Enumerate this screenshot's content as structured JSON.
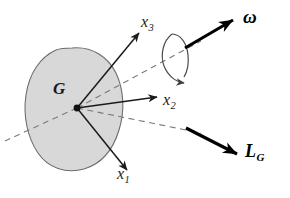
{
  "figure": {
    "background_color": "#ffffff",
    "width": 290,
    "height": 198,
    "body": {
      "name": "rigid-body-blob",
      "fill_color": "#d8d8d8",
      "stroke_color": "#6e6e6e"
    },
    "center_point": {
      "label": "G",
      "name": "center-of-mass-point",
      "x": 77,
      "y": 108,
      "color": "#111111"
    },
    "axes": [
      {
        "id": "x3",
        "label": "x",
        "subscript": "3",
        "name": "axis-x3",
        "from": [
          77,
          108
        ],
        "to": [
          140,
          32
        ],
        "color": "#1a1a1a"
      },
      {
        "id": "x2",
        "label": "x",
        "subscript": "2",
        "name": "axis-x2",
        "from": [
          77,
          108
        ],
        "to": [
          158,
          97
        ],
        "color": "#1a1a1a"
      },
      {
        "id": "x1",
        "label": "x",
        "subscript": "1",
        "name": "axis-x1",
        "from": [
          77,
          108
        ],
        "to": [
          128,
          171
        ],
        "color": "#1a1a1a"
      }
    ],
    "vectors": [
      {
        "id": "omega",
        "label": "ω",
        "subscript": "",
        "name": "angular-velocity-vector",
        "from": [
          185,
          48
        ],
        "to": [
          236,
          18
        ],
        "color": "#000000"
      },
      {
        "id": "LG",
        "label": "L",
        "subscript": "G",
        "name": "angular-momentum-vector",
        "from": [
          186,
          128
        ],
        "to": [
          241,
          156
        ],
        "color": "#000000"
      }
    ],
    "dashed_lines": [
      {
        "name": "dashed-axis-omega",
        "from": [
          77,
          108
        ],
        "to": [
          200,
          42
        ],
        "color": "#7a7a7a"
      },
      {
        "name": "dashed-axis-LG",
        "from": [
          77,
          108
        ],
        "to": [
          200,
          133
        ],
        "color": "#7a7a7a"
      },
      {
        "name": "dashed-axis-lower-left",
        "from": [
          77,
          108
        ],
        "to": [
          6,
          141
        ],
        "color": "#7a7a7a"
      }
    ],
    "rotation_arc": {
      "name": "rotation-direction-arc",
      "color": "#4a4a4a",
      "description": "curved arrow encircling the angular velocity axis"
    }
  }
}
